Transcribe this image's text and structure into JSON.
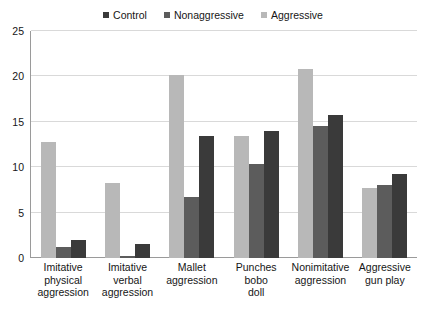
{
  "chart_data": {
    "type": "bar",
    "title": "",
    "subtitle": "",
    "xlabel": "",
    "ylabel": "",
    "ylim": [
      0,
      25
    ],
    "yticks": [
      0,
      5,
      10,
      15,
      20,
      25
    ],
    "grid": true,
    "legend_position": "top-center",
    "bar_draw_order": [
      "Aggressive",
      "Nonaggressive",
      "Control"
    ],
    "categories": [
      "Imitative physical aggression",
      "Imitative verbal aggression",
      "Mallet aggression",
      "Punches bobo doll",
      "Nonimitative aggression",
      "Aggressive gun play"
    ],
    "category_lines": [
      [
        "Imitative",
        "physical",
        "aggression"
      ],
      [
        "Imitative",
        "verbal",
        "aggression"
      ],
      [
        "Mallet",
        "aggression"
      ],
      [
        "Punches",
        "bobo",
        "doll"
      ],
      [
        "Nonimitative",
        "aggression"
      ],
      [
        "Aggressive",
        "gun play"
      ]
    ],
    "series": [
      {
        "name": "Control",
        "color": "#3a3a3a",
        "values": [
          2.0,
          1.5,
          13.4,
          14.0,
          15.7,
          9.2
        ]
      },
      {
        "name": "Nonaggressive",
        "color": "#5c5c5c",
        "values": [
          1.2,
          0.2,
          6.7,
          10.4,
          14.5,
          8.0
        ]
      },
      {
        "name": "Aggressive",
        "color": "#b8b8b8",
        "values": [
          12.8,
          8.3,
          20.2,
          13.4,
          20.8,
          7.7
        ]
      }
    ]
  }
}
